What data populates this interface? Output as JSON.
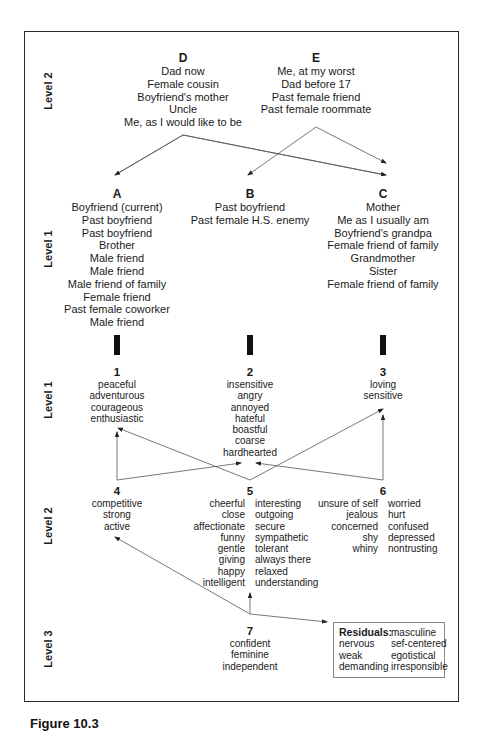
{
  "level_labels": {
    "top": "Level 2",
    "upper": "Level 1",
    "middle": "Level 1",
    "lower": "Level 2",
    "bottom": "Level 3"
  },
  "figure_groups": {
    "D": {
      "label": "D",
      "items": [
        "Dad now",
        "Female cousin",
        "Boyfriend's mother",
        "Uncle",
        "Me, as I would like to be"
      ]
    },
    "E": {
      "label": "E",
      "items": [
        "Me, at my worst",
        "Dad before 17",
        "Past female friend",
        "Past female roommate"
      ]
    },
    "A": {
      "label": "A",
      "items": [
        "Boyfriend (current)",
        "Past boyfriend",
        "Past boyfriend",
        "Brother",
        "Male friend",
        "Male friend",
        "Male friend of family",
        "Female friend",
        "Past female coworker",
        "Male friend"
      ]
    },
    "B": {
      "label": "B",
      "items": [
        "Past boyfriend",
        "Past female H.S. enemy"
      ]
    },
    "C": {
      "label": "C",
      "items": [
        "Mother",
        "Me as I usually am",
        "Boyfriend's grandpa",
        "Female friend of family",
        "Grandmother",
        "Sister",
        "Female friend of family"
      ]
    }
  },
  "trait_clusters": {
    "c1": {
      "label": "1",
      "items": [
        "peaceful",
        "adventurous",
        "courageous",
        "enthusiastic"
      ]
    },
    "c2": {
      "label": "2",
      "items": [
        "insensitive",
        "angry",
        "annoyed",
        "hateful",
        "boastful",
        "coarse",
        "hardhearted"
      ]
    },
    "c3": {
      "label": "3",
      "items": [
        "loving",
        "sensitive"
      ]
    },
    "c4": {
      "label": "4",
      "items": [
        "competitive",
        "strong",
        "active"
      ]
    },
    "c5": {
      "label": "5",
      "left": [
        "cheerful",
        "close",
        "affectionate",
        "funny",
        "gentle",
        "giving",
        "happy",
        "intelligent"
      ],
      "right": [
        "interesting",
        "outgoing",
        "secure",
        "sympathetic",
        "tolerant",
        "always there",
        "relaxed",
        "understanding"
      ]
    },
    "c6": {
      "label": "6",
      "left": [
        "unsure of self",
        "jealous",
        "concerned",
        "shy",
        "whiny"
      ],
      "right": [
        "worried",
        "hurt",
        "confused",
        "depressed",
        "nontrusting"
      ]
    },
    "c7": {
      "label": "7",
      "items": [
        "confident",
        "feminine",
        "independent"
      ]
    }
  },
  "residuals": {
    "title": "Residuals:",
    "left": [
      "nervous",
      "weak",
      "demanding"
    ],
    "right": [
      "masculine",
      "sef-centered",
      "egotistical",
      "irresponsible"
    ]
  },
  "caption": "Figure 10.3",
  "colors": {
    "line": "#555555",
    "frame": "#2a2a2a",
    "text": "#1a1a1a"
  }
}
